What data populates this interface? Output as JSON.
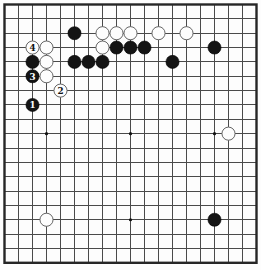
{
  "diagram": {
    "kind": "go-board-position",
    "grid_size": 19,
    "colors": {
      "page_bg": "#fdfdfd",
      "board_bg": "#fdfdfd",
      "grid_line": "#4a4a4a",
      "border_line": "#262626",
      "black_stone": "#141414",
      "black_stone_edge": "#000000",
      "black_stone_text": "#ffffff",
      "white_stone": "#fdfdfd",
      "white_stone_edge": "#666666",
      "white_stone_text": "#111111",
      "star_point": "#111111"
    },
    "star_points": [
      {
        "col": 3,
        "row": 3
      },
      {
        "col": 9,
        "row": 3
      },
      {
        "col": 15,
        "row": 3
      },
      {
        "col": 3,
        "row": 9
      },
      {
        "col": 9,
        "row": 9
      },
      {
        "col": 15,
        "row": 9
      },
      {
        "col": 3,
        "row": 15
      },
      {
        "col": 9,
        "row": 15
      },
      {
        "col": 15,
        "row": 15
      }
    ],
    "stones": [
      {
        "color": "black",
        "col": 5,
        "row": 2,
        "label": ""
      },
      {
        "color": "white",
        "col": 7,
        "row": 2,
        "label": ""
      },
      {
        "color": "white",
        "col": 8,
        "row": 2,
        "label": ""
      },
      {
        "color": "white",
        "col": 9,
        "row": 2,
        "label": ""
      },
      {
        "color": "white",
        "col": 11,
        "row": 2,
        "label": ""
      },
      {
        "color": "white",
        "col": 13,
        "row": 2,
        "label": ""
      },
      {
        "color": "white",
        "col": 2,
        "row": 3,
        "label": "4"
      },
      {
        "color": "white",
        "col": 3,
        "row": 3,
        "label": ""
      },
      {
        "color": "white",
        "col": 7,
        "row": 3,
        "label": ""
      },
      {
        "color": "black",
        "col": 8,
        "row": 3,
        "label": ""
      },
      {
        "color": "black",
        "col": 9,
        "row": 3,
        "label": ""
      },
      {
        "color": "black",
        "col": 10,
        "row": 3,
        "label": ""
      },
      {
        "color": "black",
        "col": 15,
        "row": 3,
        "label": ""
      },
      {
        "color": "black",
        "col": 2,
        "row": 4,
        "label": ""
      },
      {
        "color": "white",
        "col": 3,
        "row": 4,
        "label": ""
      },
      {
        "color": "black",
        "col": 5,
        "row": 4,
        "label": ""
      },
      {
        "color": "black",
        "col": 6,
        "row": 4,
        "label": ""
      },
      {
        "color": "black",
        "col": 7,
        "row": 4,
        "label": ""
      },
      {
        "color": "black",
        "col": 12,
        "row": 4,
        "label": ""
      },
      {
        "color": "black",
        "col": 2,
        "row": 5,
        "label": "3"
      },
      {
        "color": "white",
        "col": 3,
        "row": 5,
        "label": ""
      },
      {
        "color": "white",
        "col": 4,
        "row": 6,
        "label": "2"
      },
      {
        "color": "black",
        "col": 2,
        "row": 7,
        "label": "1"
      },
      {
        "color": "white",
        "col": 16,
        "row": 9,
        "label": ""
      },
      {
        "color": "white",
        "col": 3,
        "row": 15,
        "label": ""
      },
      {
        "color": "black",
        "col": 15,
        "row": 15,
        "label": ""
      }
    ]
  }
}
